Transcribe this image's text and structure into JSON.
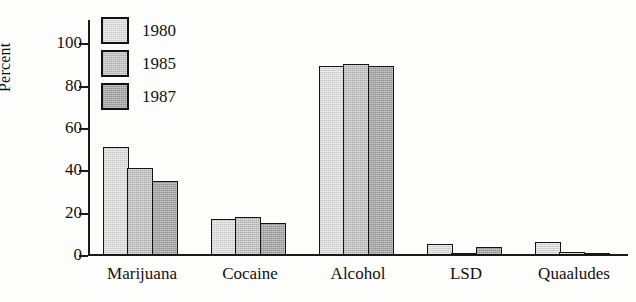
{
  "chart_data": {
    "type": "bar",
    "title": "",
    "xlabel": "",
    "ylabel": "Percent",
    "ylim": [
      0,
      110
    ],
    "yticks": [
      0,
      20,
      40,
      60,
      80,
      100
    ],
    "ytick_labels": [
      "0",
      "20",
      "40",
      "60",
      "80",
      "100"
    ],
    "grid": false,
    "legend_position": "top-left",
    "categories": [
      "Marijuana",
      "Cocaine",
      "Alcohol",
      "LSD",
      "Quaaludes"
    ],
    "series": [
      {
        "name": "1980",
        "color": "#d9d9d9",
        "values": [
          51,
          17,
          89,
          5,
          6
        ]
      },
      {
        "name": "1985",
        "color": "#c2c2c2",
        "values": [
          41,
          18,
          90,
          1,
          1.5
        ]
      },
      {
        "name": "1987",
        "color": "#a9a9a9",
        "values": [
          35,
          15,
          89,
          4,
          1
        ]
      }
    ]
  },
  "axis": {
    "outline_color": "#1a1a1a",
    "bar_outline_color": "#141414"
  }
}
